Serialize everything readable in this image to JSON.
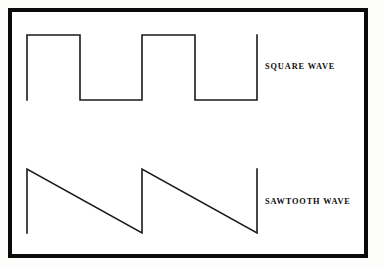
{
  "figure": {
    "background_color": "#ffffff",
    "frame_color": "#0b0b0b",
    "line_color": "#1a1a1a",
    "labels": {
      "square": "SQUARE WAVE",
      "sawtooth": "SAWTOOTH WAVE"
    }
  },
  "chart_data": {
    "type": "line",
    "title": "",
    "xlabel": "",
    "ylabel": "",
    "grid": false,
    "legend_position": "right",
    "series": [
      {
        "name": "SQUARE WAVE",
        "waveform": "square",
        "duty_cycle": 0.5,
        "cycles": 2,
        "high_level": 1,
        "low_level": 0,
        "points": [
          [
            27,
            100
          ],
          [
            27,
            35
          ],
          [
            80,
            35
          ],
          [
            80,
            100
          ],
          [
            142,
            100
          ],
          [
            142,
            35
          ],
          [
            195,
            35
          ],
          [
            195,
            100
          ],
          [
            257,
            100
          ],
          [
            257,
            35
          ]
        ]
      },
      {
        "name": "SAWTOOTH WAVE",
        "waveform": "sawtooth",
        "cycles": 2,
        "ramp_direction": "falling",
        "high_level": 1,
        "low_level": 0,
        "points": [
          [
            27,
            233
          ],
          [
            27,
            169
          ],
          [
            142,
            233
          ],
          [
            142,
            169
          ],
          [
            257,
            233
          ],
          [
            257,
            169
          ]
        ]
      }
    ]
  }
}
